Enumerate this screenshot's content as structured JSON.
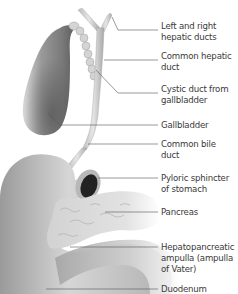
{
  "diagram": {
    "type": "anatomical illustration",
    "colors": {
      "background": "#ffffff",
      "organ_gray": "#8a8a8a",
      "leader_line": "#555555",
      "label_text": "#3a3a3a"
    },
    "labels": [
      {
        "id": "hepatic-ducts",
        "line1": "Left and right",
        "line2": "hepatic ducts",
        "top": 21
      },
      {
        "id": "common-hepatic",
        "line1": "Common hepatic",
        "line2": "duct",
        "top": 51
      },
      {
        "id": "cystic-duct",
        "line1": "Cystic duct from",
        "line2": "gallbladder",
        "top": 84
      },
      {
        "id": "gallbladder",
        "line1": "Gallbladder",
        "line2": "",
        "top": 120
      },
      {
        "id": "common-bile",
        "line1": "Common bile",
        "line2": "duct",
        "top": 139
      },
      {
        "id": "pyloric",
        "line1": "Pyloric sphincter",
        "line2": "of stomach",
        "top": 173
      },
      {
        "id": "pancreas",
        "line1": "Pancreas",
        "line2": "",
        "top": 207
      },
      {
        "id": "ampulla",
        "line1": "Hepatopancreatic",
        "line2": "ampulla (ampulla",
        "line3": "of Vater)",
        "top": 242
      },
      {
        "id": "duodenum",
        "line1": "Duodenum",
        "line2": "",
        "top": 284
      }
    ]
  }
}
